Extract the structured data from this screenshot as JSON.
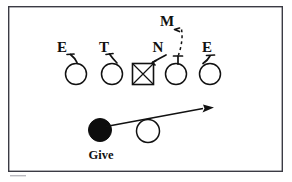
{
  "diagram": {
    "frame": {
      "x": 8,
      "y": 6,
      "width": 275,
      "height": 166,
      "stroke_color": "#3b3b44"
    },
    "colors": {
      "ink": "#111111",
      "ball_carrier_fill": "#0d0d0d",
      "frame": "#3b3b44",
      "background": "#ffffff"
    },
    "labels": [
      {
        "name": "defender-end-left",
        "text": "E",
        "x": 62,
        "y": 52
      },
      {
        "name": "defender-tackle",
        "text": "T",
        "x": 104,
        "y": 52
      },
      {
        "name": "defender-nose",
        "text": "N",
        "x": 158,
        "y": 52
      },
      {
        "name": "defender-end-right",
        "text": "E",
        "x": 207,
        "y": 52
      },
      {
        "name": "defender-mike",
        "text": "M",
        "x": 167,
        "y": 26
      },
      {
        "name": "ball-action-give",
        "text": "Give",
        "x": 88,
        "y": 159
      }
    ],
    "offensive_line": [
      {
        "name": "lineman-left-tackle",
        "shape": "circle",
        "cx": 76,
        "cy": 74,
        "r": 10.5
      },
      {
        "name": "lineman-left-guard",
        "shape": "circle",
        "cx": 112,
        "cy": 74,
        "r": 10.5
      },
      {
        "name": "center",
        "shape": "square-x",
        "cx": 143,
        "cy": 74,
        "size": 21
      },
      {
        "name": "lineman-right-guard",
        "shape": "circle",
        "cx": 176,
        "cy": 74,
        "r": 10.5
      },
      {
        "name": "lineman-right-tackle",
        "shape": "circle",
        "cx": 210,
        "cy": 74,
        "r": 10.5
      }
    ],
    "backfield": [
      {
        "name": "ball-carrier",
        "shape": "filled-circle",
        "cx": 100,
        "cy": 130,
        "r": 11.5
      },
      {
        "name": "quarterback",
        "shape": "open-circle",
        "cx": 148,
        "cy": 131,
        "r": 11.5
      }
    ],
    "run_arrow": {
      "name": "run-path-arrow",
      "start_x": 106,
      "start_y": 126,
      "end_x": 213,
      "end_y": 107,
      "direction": "right-upfield"
    },
    "mike_path": {
      "name": "mike-blitz-dashed-path",
      "style": "dashed",
      "start_x": 181,
      "start_y": 29,
      "end_x": 178,
      "end_y": 56
    },
    "defender_alignment_marks": [
      {
        "name": "alignment-mark-end-left",
        "from_x": 68,
        "from_y": 56,
        "to_x": 76,
        "to_y": 63
      },
      {
        "name": "alignment-mark-tackle",
        "from_x": 110,
        "from_y": 56,
        "to_x": 116,
        "to_y": 64
      },
      {
        "name": "alignment-mark-nose",
        "from_x": 164,
        "from_y": 56,
        "to_x": 152,
        "to_y": 63
      },
      {
        "name": "alignment-mark-end-right",
        "from_x": 212,
        "from_y": 56,
        "to_x": 206,
        "to_y": 64
      },
      {
        "name": "stem-nose-vertical",
        "from_x": 178,
        "from_y": 56,
        "to_x": 178,
        "to_y": 64
      }
    ]
  }
}
